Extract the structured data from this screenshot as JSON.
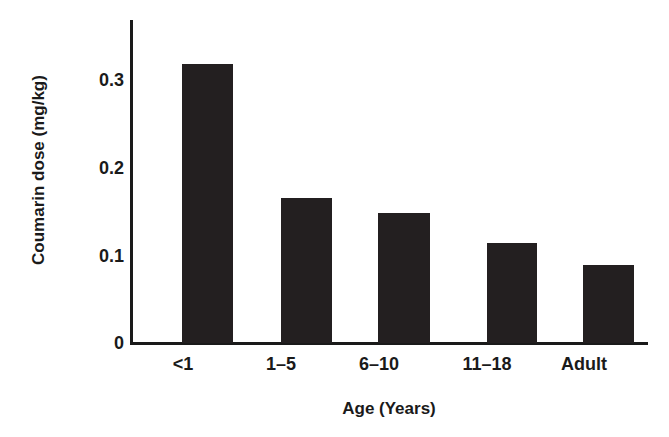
{
  "chart_data": {
    "type": "bar",
    "title": "",
    "subtitle": "",
    "xlabel": "Age (Years)",
    "ylabel": "Coumarin dose (mg/kg)",
    "categories": [
      "<1",
      "1–5",
      "6–10",
      "11–18",
      "Adult"
    ],
    "values": [
      0.32,
      0.166,
      0.149,
      0.114,
      0.089
    ],
    "series": [
      {
        "name": "Coumarin dose",
        "values": [
          0.32,
          0.166,
          0.149,
          0.114,
          0.089
        ]
      }
    ],
    "ylim": [
      0,
      0.37
    ],
    "xlim": [
      0,
      5
    ],
    "ytick_labels": [
      "0",
      "0.1",
      "0.2",
      "0.3"
    ],
    "ytick_values": [
      0,
      0.1,
      0.2,
      0.3
    ],
    "grid": false,
    "legend": false,
    "legend_position": "none",
    "bar_color": "#231f20",
    "axis_color": "#1a1a1a",
    "background_color": "#ffffff",
    "annotations": []
  },
  "axes": {
    "y_title": "Coumarin dose (mg/kg)",
    "x_title": "Age (Years)"
  }
}
